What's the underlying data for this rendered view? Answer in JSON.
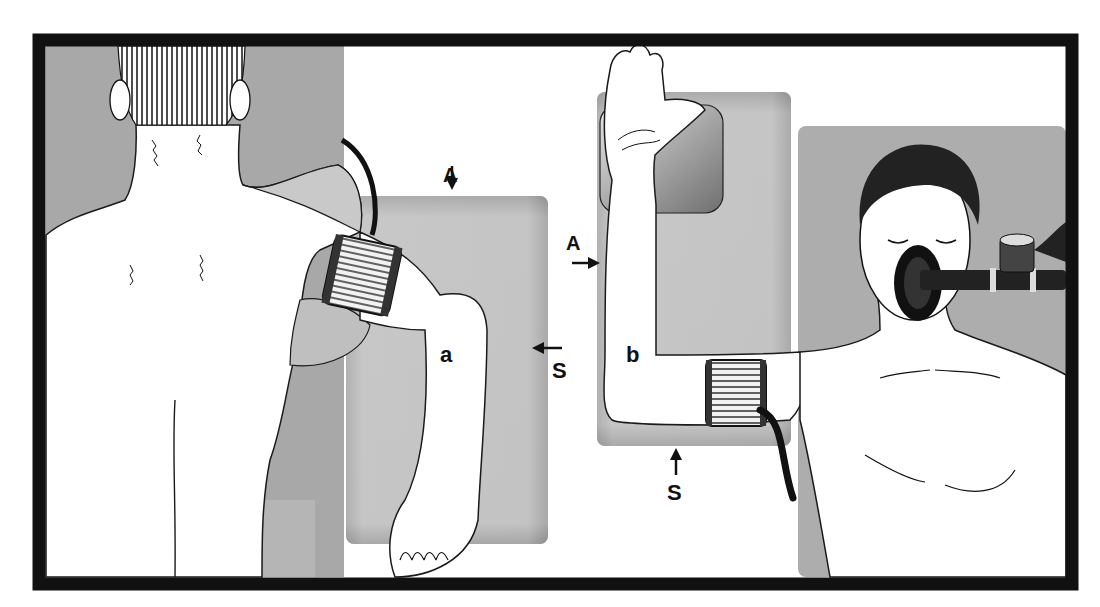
{
  "figure": {
    "panels": [
      {
        "id": "a",
        "label": "a",
        "view": "posterior view, seated patient, arm abducted over board with BP cuff on upper arm",
        "arrows": [
          {
            "label": "A",
            "direction": "down"
          },
          {
            "label": "S",
            "direction": "left"
          }
        ]
      },
      {
        "id": "b",
        "label": "b",
        "view": "anterior view, supine patient with anesthesia face mask, arm abducted and flexed on arm board with BP cuff",
        "arrows": [
          {
            "label": "A",
            "direction": "right"
          },
          {
            "label": "S",
            "direction": "up"
          }
        ]
      }
    ],
    "colors": {
      "frame": "#111111",
      "board": "#bdbdbd",
      "background_panel": "#a9a9a9",
      "skin": "#ffffff",
      "line": "#1a1a1a"
    }
  }
}
